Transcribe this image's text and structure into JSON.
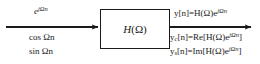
{
  "figure": {
    "type": "block-diagram",
    "background_color": "#ffffff",
    "line_color": "#1a1a1a"
  },
  "block": {
    "label_full": "H(Ω)",
    "label_function": "H",
    "label_open": "(",
    "label_omega": "Ω",
    "label_close": ")"
  },
  "input": {
    "arrow_name": "input-arrow",
    "labels": {
      "complex_exponential": {
        "base": "e",
        "exponent": "jΩn",
        "full": "e^{jΩn}"
      },
      "cosine": "cos Ωn",
      "sine": "sin Ωn"
    }
  },
  "output": {
    "arrow_name": "output-arrow",
    "labels": {
      "complex": {
        "lhs": "y[n]=H(Ω)e",
        "exponent": "jΩn",
        "full": "y[n]=H(Ω)e^{jΩn}"
      },
      "cosine_response": {
        "prefix": "y",
        "subscript": "c",
        "mid": "[n]=Re[H(Ω)e",
        "exponent": "jΩn",
        "suffix": "]",
        "full": "y_c[n]=Re[H(Ω)e^{jΩn}]"
      },
      "sine_response": {
        "prefix": "y",
        "subscript": "s",
        "mid": "[n]=Im[H(Ω)e",
        "exponent": "jΩn",
        "suffix": "]",
        "full": "y_s[n]=Im[H(Ω)e^{jΩn}]"
      }
    }
  }
}
